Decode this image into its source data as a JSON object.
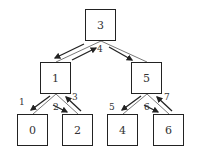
{
  "diagram": {
    "type": "binary-tree-traversal",
    "nodes": [
      {
        "id": "n3",
        "label": "3",
        "x": 85,
        "y": 9
      },
      {
        "id": "n1",
        "label": "1",
        "x": 40,
        "y": 62
      },
      {
        "id": "n5",
        "label": "5",
        "x": 131,
        "y": 62
      },
      {
        "id": "n0",
        "label": "0",
        "x": 17,
        "y": 114
      },
      {
        "id": "n2",
        "label": "2",
        "x": 62,
        "y": 114
      },
      {
        "id": "n4",
        "label": "4",
        "x": 107,
        "y": 114
      },
      {
        "id": "n6",
        "label": "6",
        "x": 153,
        "y": 114
      }
    ],
    "edges": [
      {
        "from": "3",
        "to": "1"
      },
      {
        "from": "3",
        "to": "5"
      },
      {
        "from": "1",
        "to": "0"
      },
      {
        "from": "1",
        "to": "2"
      },
      {
        "from": "5",
        "to": "4"
      },
      {
        "from": "5",
        "to": "6"
      }
    ],
    "step_labels": [
      {
        "text": "1",
        "x": 19,
        "y": 98
      },
      {
        "text": "2",
        "x": 53,
        "y": 103
      },
      {
        "text": "3",
        "x": 72,
        "y": 93
      },
      {
        "text": "4",
        "x": 97,
        "y": 45
      },
      {
        "text": "5",
        "x": 109,
        "y": 103
      },
      {
        "text": "6",
        "x": 144,
        "y": 103
      },
      {
        "text": "7",
        "x": 164,
        "y": 93
      }
    ],
    "colors": {
      "line": "#222222",
      "arrow": "#222222",
      "text": "#333333"
    }
  }
}
